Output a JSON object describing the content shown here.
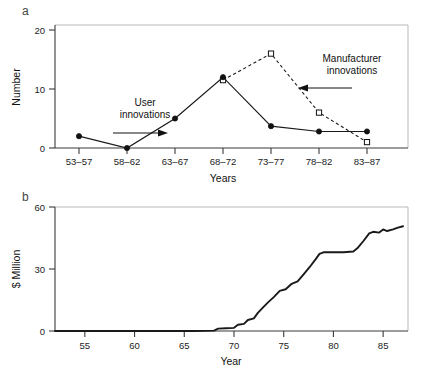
{
  "figure": {
    "panel_a_label": "a",
    "panel_b_label": "b"
  },
  "chart_data": [
    {
      "panel": "a",
      "type": "line",
      "title": "",
      "xlabel": "Years",
      "ylabel": "Number",
      "categories": [
        "53–57",
        "58–62",
        "63–67",
        "68–72",
        "73–77",
        "78–82",
        "83–87"
      ],
      "yticks": [
        0,
        10,
        20
      ],
      "ylim": [
        0,
        21
      ],
      "grid": false,
      "legend": "annotations",
      "series": [
        {
          "name": "User innovations",
          "style": "solid",
          "marker": "filled-circle",
          "values": [
            2,
            0,
            5,
            12,
            3.7,
            2.8,
            2.8
          ]
        },
        {
          "name": "Manufacturer innovations",
          "style": "dashed",
          "marker": "open-square",
          "values": [
            null,
            null,
            null,
            11.5,
            16,
            6,
            1
          ]
        }
      ],
      "annotations": [
        {
          "text_line1": "User",
          "text_line2": "innovations",
          "arrow": "right"
        },
        {
          "text_line1": "Manufacturer",
          "text_line2": "innovations",
          "arrow": "left"
        }
      ]
    },
    {
      "panel": "b",
      "type": "line",
      "title": "",
      "xlabel": "Year",
      "ylabel": "$ Million",
      "xticks": [
        55,
        60,
        65,
        70,
        75,
        80,
        85
      ],
      "yticks": [
        0,
        30,
        60
      ],
      "xlim": [
        52,
        87.5
      ],
      "ylim": [
        0,
        63
      ],
      "grid": false,
      "series": [
        {
          "name": "Cumulative sales",
          "style": "solid",
          "marker": "none",
          "x": [
            52,
            66,
            68,
            68.4,
            69.2,
            70,
            70.4,
            71,
            71.4,
            72,
            72.4,
            73,
            73.4,
            74,
            74.6,
            75.2,
            75.8,
            76.4,
            77,
            77.6,
            78.2,
            78.6,
            79,
            80,
            81,
            82,
            82.4,
            83,
            83.6,
            84,
            84.6,
            85,
            85.4,
            86,
            86.4,
            87
          ],
          "y": [
            0,
            0,
            0.2,
            1.2,
            1.4,
            1.6,
            3.2,
            3.6,
            5.6,
            6.4,
            9.2,
            12.4,
            14.4,
            17.2,
            20.4,
            21.2,
            24,
            25.2,
            28.8,
            32.4,
            36.4,
            39.2,
            40,
            40,
            40,
            40.4,
            42,
            45.6,
            49.6,
            50.4,
            50,
            51.6,
            50.8,
            51.6,
            52.4,
            53.2
          ]
        }
      ]
    }
  ]
}
